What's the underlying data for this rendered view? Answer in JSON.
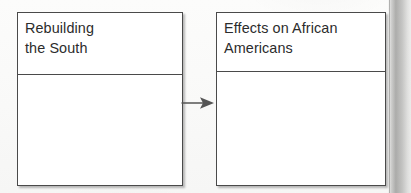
{
  "diagram": {
    "type": "graphic-organizer",
    "title": "",
    "background_color": "#fbfbfa",
    "box_border_color": "#4a4a4a",
    "text_color": "#2c2c2c",
    "boxes": [
      {
        "id": "rebuilding-the-south",
        "header": "Rebuilding\nthe South",
        "body": ""
      },
      {
        "id": "effects-african-americans",
        "header": "Effects on African\nAmericans",
        "body": ""
      }
    ],
    "connector": {
      "icon": "arrow-right-icon",
      "from": "rebuilding-the-south",
      "to": "effects-african-americans",
      "color": "#555555"
    }
  }
}
